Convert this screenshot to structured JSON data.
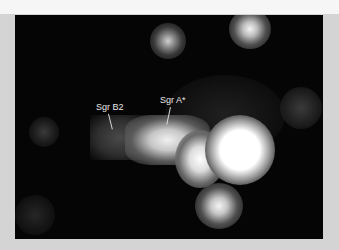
{
  "figure": {
    "type": "sky-map",
    "labels": [
      {
        "id": "sgr-b2",
        "text": "Sgr B2"
      },
      {
        "id": "sgr-a-star",
        "text": "Sgr A*"
      }
    ]
  },
  "colors": {
    "background": "#050505",
    "frame": "#d4d4d4",
    "top_strip": "#f6f6f6",
    "label": "#e8e8e8"
  }
}
